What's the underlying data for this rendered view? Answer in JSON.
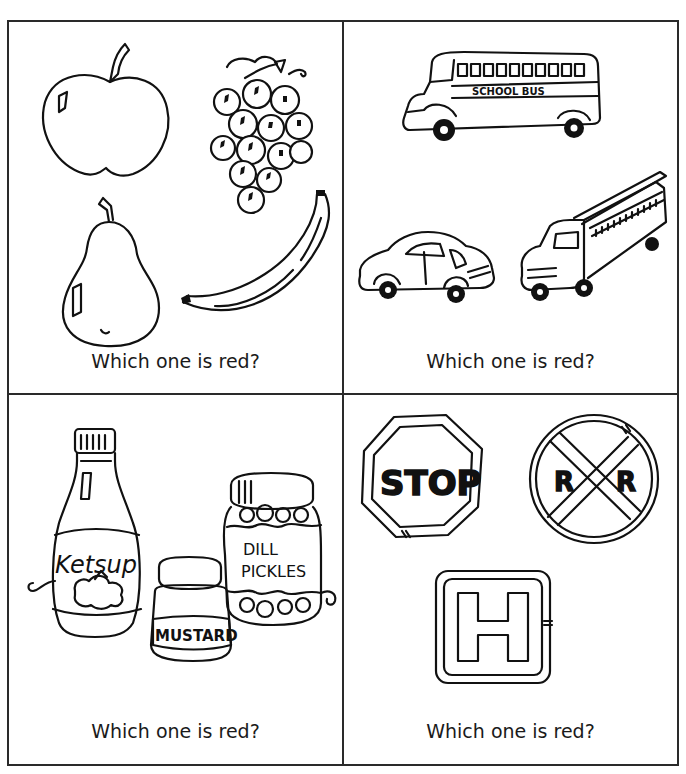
{
  "worksheet": {
    "panels": [
      {
        "id": "fruits",
        "caption": "Which one is red?",
        "items": [
          {
            "name": "apple",
            "icon": "apple-icon"
          },
          {
            "name": "grapes",
            "icon": "grapes-icon"
          },
          {
            "name": "pear",
            "icon": "pear-icon"
          },
          {
            "name": "banana",
            "icon": "banana-icon"
          }
        ]
      },
      {
        "id": "vehicles",
        "caption": "Which one is red?",
        "items": [
          {
            "name": "school bus",
            "icon": "school-bus-icon",
            "label": "SCHOOL BUS"
          },
          {
            "name": "car",
            "icon": "car-icon"
          },
          {
            "name": "fire truck",
            "icon": "fire-truck-icon"
          }
        ]
      },
      {
        "id": "condiments",
        "caption": "Which one is red?",
        "items": [
          {
            "name": "ketchup bottle",
            "icon": "ketchup-bottle-icon",
            "label": "Ketsup"
          },
          {
            "name": "mustard jar",
            "icon": "mustard-jar-icon",
            "label": "MUSTARD"
          },
          {
            "name": "pickle jar",
            "icon": "pickle-jar-icon",
            "label_line1": "DILL",
            "label_line2": "PICKLES"
          }
        ]
      },
      {
        "id": "signs",
        "caption": "Which one is red?",
        "items": [
          {
            "name": "stop sign",
            "icon": "stop-sign-icon",
            "label": "STOP"
          },
          {
            "name": "railroad crossing sign",
            "icon": "railroad-crossing-icon",
            "label_left": "R",
            "label_right": "R"
          },
          {
            "name": "hospital sign",
            "icon": "hospital-sign-icon",
            "label": "H"
          }
        ]
      }
    ]
  }
}
